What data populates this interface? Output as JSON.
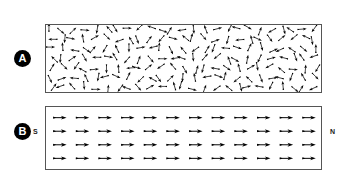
{
  "figure": {
    "background_color": "#ffffff",
    "frame_color": "#3a3a3a",
    "arrow_color": "#000000"
  },
  "panels": [
    {
      "id": "panel-a",
      "badge_label": "A",
      "state": "unmagnetized",
      "arrow_arrangement": "random",
      "rows": 7,
      "cols": 25,
      "left_label": "",
      "right_label": ""
    },
    {
      "id": "panel-b",
      "badge_label": "B",
      "state": "magnetized",
      "arrow_arrangement": "aligned-right",
      "rows": 4,
      "cols": 12,
      "left_label": "S",
      "right_label": "N"
    }
  ],
  "chart_data": {
    "type": "scatter",
    "xlabel": "",
    "ylabel": "",
    "panel_a_angles_deg": [
      270,
      40,
      315,
      5,
      100,
      230,
      60,
      0,
      135,
      200,
      20,
      300,
      170,
      85,
      250,
      345,
      115,
      195,
      30,
      290,
      150,
      75,
      215,
      355,
      125,
      180,
      95,
      10,
      260,
      330,
      45,
      160,
      240,
      70,
      305,
      130,
      15,
      220,
      285,
      50,
      340,
      105,
      175,
      255,
      25,
      55,
      320,
      140,
      205,
      80,
      0,
      265,
      190,
      35,
      310,
      120,
      245,
      90,
      350,
      165,
      275,
      65,
      230,
      145,
      300,
      110,
      185,
      20,
      295,
      75,
      335,
      155,
      215,
      40,
      270,
      225,
      95,
      325,
      60,
      180,
      10,
      240,
      130,
      290,
      50,
      360,
      170,
      200,
      85,
      310,
      140,
      250,
      30,
      280,
      115,
      345,
      195,
      70,
      235,
      160,
      300,
      45,
      125,
      210,
      355,
      90,
      265,
      175,
      15,
      320,
      145,
      230,
      60,
      285,
      105,
      190,
      35,
      255,
      330,
      80,
      150,
      220,
      5,
      275,
      120,
      65,
      340,
      185,
      245,
      100,
      165,
      25,
      295,
      135,
      210,
      55,
      315,
      95,
      260,
      170,
      20,
      285,
      140,
      225,
      70,
      350,
      195,
      110,
      240,
      45,
      305,
      160,
      230,
      85,
      0,
      275,
      125,
      200,
      50,
      330,
      180,
      255,
      105,
      15,
      290,
      145,
      220,
      75,
      345,
      190,
      115,
      265,
      40,
      300,
      155
    ],
    "panel_b_angle_deg": 0,
    "panel_b_grid": {
      "rows": 4,
      "cols": 12
    },
    "legend": []
  },
  "labels": {
    "badge_a": "A",
    "badge_b": "B",
    "south_pole": "S",
    "north_pole": "N"
  }
}
